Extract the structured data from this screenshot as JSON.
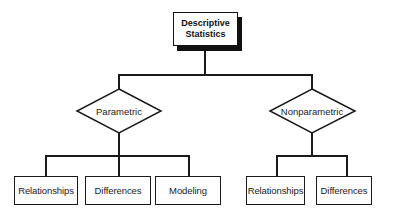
{
  "diagram": {
    "type": "hierarchy",
    "root": {
      "line1": "Descriptive",
      "line2": "Statistics"
    },
    "branches": [
      {
        "label": "Parametric",
        "shape": "diamond",
        "children": [
          "Relationships",
          "Differences",
          "Modeling"
        ]
      },
      {
        "label": "Nonparametric",
        "shape": "diamond",
        "children": [
          "Relationships",
          "Differences"
        ]
      }
    ],
    "colors": {
      "line": "#1a1a1a",
      "background": "#ffffff"
    }
  }
}
